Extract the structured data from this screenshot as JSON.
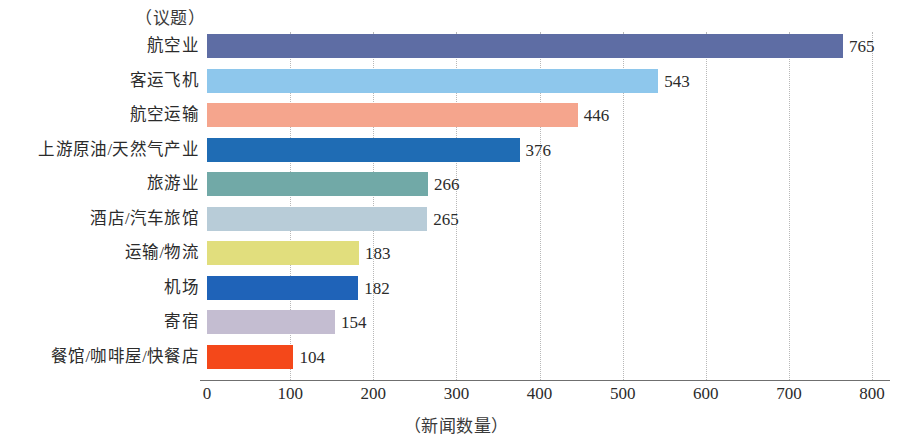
{
  "chart_data": {
    "type": "bar",
    "orientation": "horizontal",
    "title": "",
    "xlabel": "（新闻数量）",
    "ylabel": "（议题）",
    "xlim": [
      0,
      800
    ],
    "xticks": [
      0,
      100,
      200,
      300,
      400,
      500,
      600,
      700,
      800
    ],
    "xtick_labels": [
      "0",
      "100",
      "200",
      "300",
      "400",
      "500",
      "600",
      "700",
      "800"
    ],
    "grid": "vertical-dotted",
    "legend": "none",
    "categories": [
      "航空业",
      "客运飞机",
      "航空运输",
      "上游原油/天然气产业",
      "旅游业",
      "酒店/汽车旅馆",
      "运输/物流",
      "机场",
      "寄宿",
      "餐馆/咖啡屋/快餐店"
    ],
    "values": [
      765,
      543,
      446,
      376,
      266,
      265,
      183,
      182,
      154,
      104
    ],
    "value_labels": [
      "765",
      "543",
      "446",
      "376",
      "266",
      "265",
      "183",
      "182",
      "154",
      "104"
    ],
    "colors": [
      "#5e6da4",
      "#8ec7ec",
      "#f5a58d",
      "#1f6cb4",
      "#71a9a7",
      "#b8ccd8",
      "#e1de7d",
      "#1f63b8",
      "#c4bdd1",
      "#f4481a"
    ],
    "bars": [
      {
        "label": "航空业",
        "value": 765,
        "value_label": "765",
        "color": "#5e6da4"
      },
      {
        "label": "客运飞机",
        "value": 543,
        "value_label": "543",
        "color": "#8ec7ec"
      },
      {
        "label": "航空运输",
        "value": 446,
        "value_label": "446",
        "color": "#f5a58d"
      },
      {
        "label": "上游原油/天然气产业",
        "value": 376,
        "value_label": "376",
        "color": "#1f6cb4"
      },
      {
        "label": "旅游业",
        "value": 266,
        "value_label": "266",
        "color": "#71a9a7"
      },
      {
        "label": "酒店/汽车旅馆",
        "value": 265,
        "value_label": "265",
        "color": "#b8ccd8"
      },
      {
        "label": "运输/物流",
        "value": 183,
        "value_label": "183",
        "color": "#e1de7d"
      },
      {
        "label": "机场",
        "value": 182,
        "value_label": "182",
        "color": "#1f63b8"
      },
      {
        "label": "寄宿",
        "value": 154,
        "value_label": "154",
        "color": "#c4bdd1"
      },
      {
        "label": "餐馆/咖啡屋/快餐店",
        "value": 104,
        "value_label": "104",
        "color": "#f4481a"
      }
    ]
  },
  "axis": {
    "y_caption": "（议题）",
    "x_caption": "（新闻数量）"
  }
}
